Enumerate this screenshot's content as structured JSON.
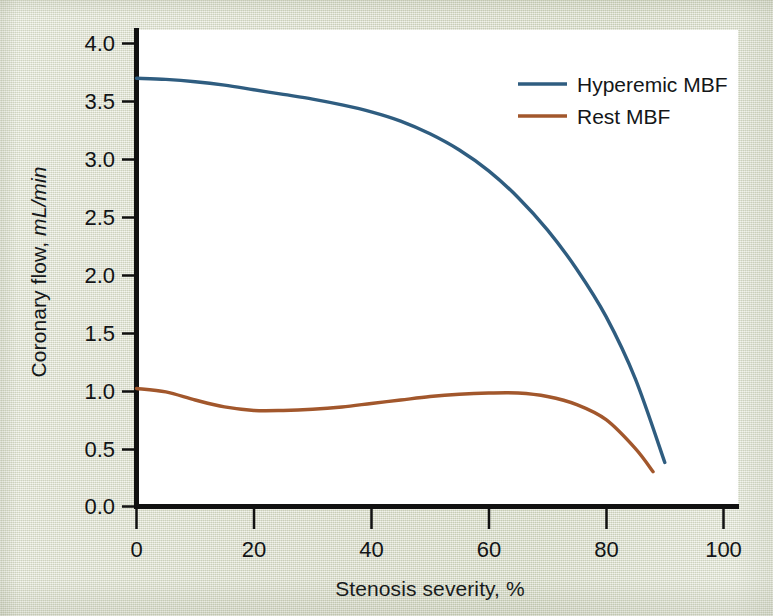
{
  "figure": {
    "background_color": "#dde1cf",
    "plot_background_color": "#ffffff",
    "axis_color": "#111111"
  },
  "axes": {
    "y_title_main": "Coronary flow, ",
    "y_title_units": "mL/min",
    "x_title": "Stenosis severity, %"
  },
  "legend": {
    "items": [
      {
        "label": "Hyperemic MBF",
        "color": "#2f5d80"
      },
      {
        "label": "Rest MBF",
        "color": "#a2572c"
      }
    ]
  },
  "chart_data": {
    "type": "line",
    "title": "",
    "xlabel": "Stenosis severity, %",
    "ylabel": "Coronary flow, mL/min",
    "xlim": [
      0,
      100
    ],
    "ylim": [
      0,
      4.0
    ],
    "xticks": [
      "0",
      "20",
      "40",
      "60",
      "80",
      "100"
    ],
    "yticks": [
      "0.0",
      "0.5",
      "1.0",
      "1.5",
      "2.0",
      "2.5",
      "3.0",
      "3.5",
      "4.0"
    ],
    "grid": false,
    "legend_position": "upper right",
    "series": [
      {
        "name": "Hyperemic MBF",
        "color": "#2f5d80",
        "x": [
          0,
          5,
          10,
          15,
          20,
          25,
          30,
          35,
          40,
          45,
          50,
          55,
          60,
          65,
          70,
          75,
          80,
          85,
          90
        ],
        "values": [
          3.7,
          3.69,
          3.67,
          3.64,
          3.6,
          3.56,
          3.52,
          3.47,
          3.41,
          3.33,
          3.22,
          3.08,
          2.9,
          2.67,
          2.39,
          2.05,
          1.64,
          1.1,
          0.38
        ]
      },
      {
        "name": "Rest MBF",
        "color": "#a2572c",
        "x": [
          0,
          5,
          10,
          15,
          20,
          25,
          30,
          35,
          40,
          45,
          50,
          55,
          60,
          65,
          70,
          75,
          80,
          85,
          88
        ],
        "values": [
          1.02,
          0.99,
          0.92,
          0.86,
          0.83,
          0.83,
          0.84,
          0.86,
          0.89,
          0.92,
          0.95,
          0.97,
          0.98,
          0.98,
          0.95,
          0.88,
          0.75,
          0.5,
          0.3
        ]
      }
    ]
  }
}
